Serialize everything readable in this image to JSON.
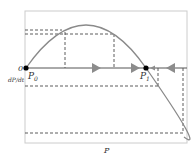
{
  "diagram": {
    "x_axis_label": "P",
    "y_axis_label": "dP/dt",
    "origin_label": "0",
    "points": [
      {
        "name": "P0",
        "label": "P",
        "subscript": "0",
        "type": "fixed-point"
      },
      {
        "name": "P1",
        "label": "P",
        "subscript": "1",
        "type": "fixed-point"
      }
    ],
    "colors": {
      "curve": "#8a8a8a",
      "axis": "#555555",
      "dash": "#333333",
      "arrow": "#8c8c8c",
      "frame": "#cccccc",
      "point": "#000000"
    }
  }
}
